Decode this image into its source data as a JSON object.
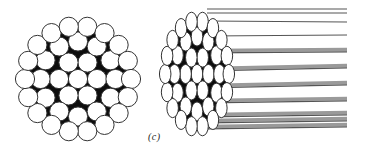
{
  "figure": {
    "caption": "(c)",
    "colors": {
      "background": "#ffffff",
      "wire_fill": "#ffffff",
      "wire_outline": "#333333",
      "fill_between_wires": "#0d0d0d",
      "strand_line": "#555555",
      "strand_shade": "#9a9a9a"
    },
    "cross_section": {
      "description": "Cross section of 37-wire strand (1+6+12+18)",
      "center": [
        78,
        79
      ],
      "wire_radius": 9.6,
      "layers": [
        {
          "count": 1,
          "radius": 0
        },
        {
          "count": 6,
          "radius": 19
        },
        {
          "count": 12,
          "radius": 37.5
        },
        {
          "count": 18,
          "radius": 53
        }
      ]
    },
    "perspective_view": {
      "description": "Perspective view of strand with wires extending right",
      "face_center": [
        197,
        74
      ],
      "scale_x": 0.6,
      "scale_y": 1.0,
      "wire_radius": 9.6,
      "layers": [
        {
          "count": 1,
          "radius": 0
        },
        {
          "count": 6,
          "radius": 19
        },
        {
          "count": 12,
          "radius": 37.5
        },
        {
          "count": 18,
          "radius": 53
        }
      ],
      "line_end_x": 347,
      "strands": [
        {
          "y1": 9,
          "y2": 9,
          "width": 1.2,
          "shaded": false
        },
        {
          "y1": 13,
          "y2": 13,
          "width": 1.2,
          "shaded": false
        },
        {
          "y1": 21,
          "y2": 22,
          "width": 1.2,
          "shaded": false
        },
        {
          "y1": 36,
          "y2": 35,
          "width": 1.2,
          "shaded": false
        },
        {
          "y1": 52,
          "y2": 51,
          "width": 3.5,
          "shaded": true
        },
        {
          "y1": 70,
          "y2": 67,
          "width": 3.5,
          "shaded": true
        },
        {
          "y1": 87,
          "y2": 84,
          "width": 3.5,
          "shaded": true
        },
        {
          "y1": 102,
          "y2": 100,
          "width": 3.5,
          "shaded": true
        },
        {
          "y1": 116,
          "y2": 114,
          "width": 3.5,
          "shaded": true
        },
        {
          "y1": 122,
          "y2": 120,
          "width": 3.5,
          "shaded": true
        },
        {
          "y1": 128,
          "y2": 126,
          "width": 3.5,
          "shaded": true
        }
      ]
    }
  }
}
